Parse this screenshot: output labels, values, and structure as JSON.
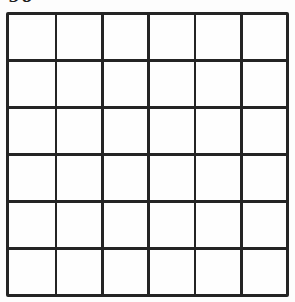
{
  "grid": {
    "label": "90",
    "rows": 6,
    "columns": 6,
    "line_color": "#242424",
    "cell_background": "#fefefe",
    "page_background": "#fdfdfd"
  }
}
